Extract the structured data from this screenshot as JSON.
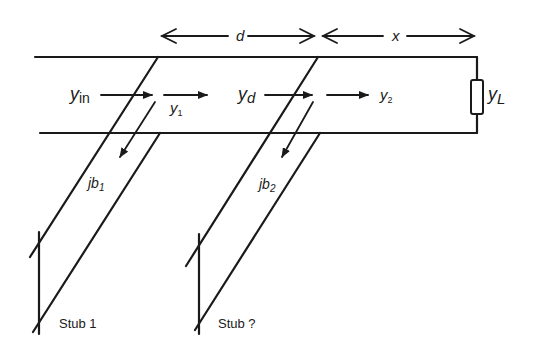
{
  "figure": {
    "type": "double-stub matching network on transmission line",
    "colors": {
      "ink": "#1a1a1a",
      "background": "#ffffff"
    }
  },
  "dimensions": {
    "d": {
      "label": "d",
      "from_x": 160,
      "to_x": 315,
      "y": 36
    },
    "x": {
      "label": "x",
      "from_x": 322,
      "to_x": 475,
      "y": 36
    }
  },
  "line": {
    "top_y": 57,
    "bottom_y": 133,
    "left_top_x": 35,
    "left_bottom_x": 40,
    "right_x": 477
  },
  "load": {
    "label_main": "y",
    "label_sub": "L",
    "box": {
      "x": 471,
      "y": 80,
      "w": 12,
      "h": 34
    }
  },
  "admittances": {
    "y_in": {
      "main": "y",
      "sub": "in"
    },
    "y_1": {
      "main": "y",
      "sub": "1"
    },
    "y_d": {
      "main": "y",
      "sub": "d"
    },
    "y_2": {
      "main": "y",
      "sub": "2"
    }
  },
  "stubs": [
    {
      "name": "Stub 1",
      "susceptance": {
        "prefix": "jb",
        "sub": "1"
      },
      "outer": [
        [
          158,
          57
        ],
        [
          30,
          257
        ]
      ],
      "inner": [
        [
          160,
          133
        ],
        [
          33,
          332
        ]
      ],
      "short": [
        [
          39,
          232
        ],
        [
          39,
          334
        ]
      ],
      "arrow": [
        [
          155,
          102
        ],
        [
          118,
          162
        ]
      ]
    },
    {
      "name": "Stub ?",
      "susceptance": {
        "prefix": "jb",
        "sub": "2"
      },
      "outer": [
        [
          318,
          57
        ],
        [
          186,
          266
        ]
      ],
      "inner": [
        [
          320,
          133
        ],
        [
          195,
          330
        ]
      ],
      "short": [
        [
          199,
          234
        ],
        [
          199,
          334
        ]
      ],
      "arrow": [
        [
          313,
          102
        ],
        [
          280,
          162
        ]
      ]
    }
  ]
}
